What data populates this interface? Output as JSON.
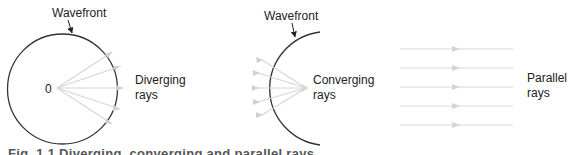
{
  "figure": {
    "panels": [
      {
        "id": "diverging",
        "wavefront_label": "Wavefront",
        "origin_label": "0",
        "rays_label_line1": "Diverging",
        "rays_label_line2": "rays"
      },
      {
        "id": "converging",
        "wavefront_label": "Wavefront",
        "rays_label_line1": "Converging",
        "rays_label_line2": "rays"
      },
      {
        "id": "parallel",
        "rays_label_line1": "Parallel",
        "rays_label_line2": "rays"
      }
    ],
    "caption": "Fig. 1.1 Diverging, converging and parallel rays"
  },
  "colors": {
    "wavefront_stroke": "#333333",
    "ray_stroke": "#d6d6d6",
    "text": "#222222"
  }
}
